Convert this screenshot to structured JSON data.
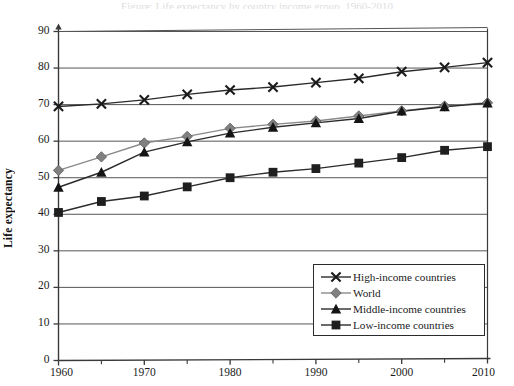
{
  "figure": {
    "background_color": "#ffffff",
    "frame_color": "#3a3a3a",
    "gridline_color": "#555555",
    "top_cropped_caption": "Figure: Life expectancy by country income group, 1960-2010"
  },
  "axes": {
    "y_title": "Life expectancy",
    "y_ticks": [
      0,
      10,
      20,
      30,
      40,
      50,
      60,
      70,
      80,
      90
    ],
    "y_tick_labels": [
      "0",
      "10",
      "20",
      "30",
      "40",
      "50",
      "60",
      "70",
      "80",
      "90"
    ],
    "x_ticks": [
      1960,
      1970,
      1980,
      1990,
      2000,
      2010
    ],
    "x_tick_labels": [
      "1960",
      "1970",
      "1980",
      "1990",
      "2000",
      "2010"
    ],
    "x_minor_ticks": [
      1965,
      1975,
      1985,
      1995,
      2005
    ]
  },
  "legend": {
    "position": "bottom-right",
    "items": [
      {
        "label": "High-income countries",
        "marker": "x-cross",
        "color": "#1a1a1a",
        "line_color": "#2b2b2b"
      },
      {
        "label": "World",
        "marker": "diamond",
        "color": "#808080",
        "line_color": "#8a8a8a"
      },
      {
        "label": "Middle-income countries",
        "marker": "triangle",
        "color": "#141414",
        "line_color": "#2b2b2b"
      },
      {
        "label": "Low-income countries",
        "marker": "square",
        "color": "#1f1f1f",
        "line_color": "#2b2b2b"
      }
    ]
  },
  "chart_data": {
    "type": "line",
    "title": "",
    "xlabel": "",
    "ylabel": "Life expectancy",
    "xlim": [
      1960,
      2010
    ],
    "ylim": [
      0,
      90
    ],
    "grid": true,
    "legend_position": "lower right",
    "x": [
      1960,
      1965,
      1970,
      1975,
      1980,
      1985,
      1990,
      1995,
      2000,
      2005,
      2010
    ],
    "series": [
      {
        "name": "High-income countries",
        "marker": "x-cross",
        "color": "#1a1a1a",
        "values": [
          69.5,
          70.2,
          71.3,
          72.8,
          74.0,
          74.8,
          76.0,
          77.2,
          79.0,
          80.2,
          81.5
        ]
      },
      {
        "name": "World",
        "marker": "diamond",
        "color": "#808080",
        "values": [
          52.0,
          55.7,
          59.5,
          61.3,
          63.5,
          64.6,
          65.5,
          66.9,
          68.3,
          69.6,
          70.5
        ]
      },
      {
        "name": "Middle-income countries",
        "marker": "triangle",
        "color": "#141414",
        "values": [
          47.4,
          51.5,
          57.0,
          59.8,
          62.2,
          63.8,
          65.0,
          66.2,
          68.2,
          69.4,
          70.4
        ]
      },
      {
        "name": "Low-income countries",
        "marker": "square",
        "color": "#1f1f1f",
        "values": [
          40.5,
          43.5,
          45.0,
          47.5,
          50.0,
          51.5,
          52.5,
          54.0,
          55.5,
          57.5,
          58.5
        ]
      }
    ]
  }
}
